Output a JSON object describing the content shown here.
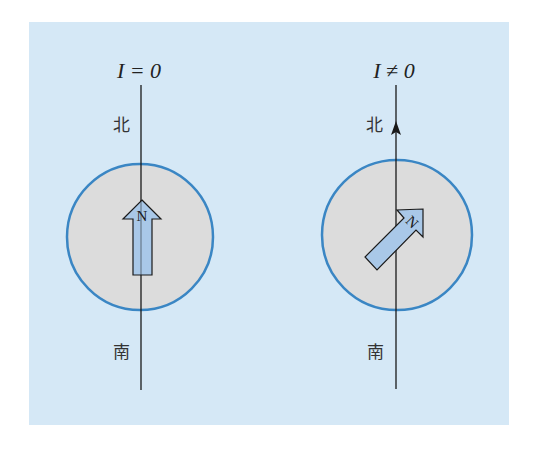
{
  "colors": {
    "panel_bg": "#d5e8f6",
    "circle_fill": "#dcdcdc",
    "circle_stroke": "#3a86c4",
    "needle_fill": "#a9c8e8",
    "line": "#1a1a1a"
  },
  "panels": [
    {
      "id": "no-current",
      "current_label": "I = 0",
      "north_label": "北",
      "south_label": "南",
      "needle_label": "N",
      "needle_angle_deg": 0,
      "wire_has_current_arrow": false
    },
    {
      "id": "with-current",
      "current_label": "I ≠ 0",
      "north_label": "北",
      "south_label": "南",
      "needle_label": "N",
      "needle_angle_deg": 45,
      "wire_has_current_arrow": true
    }
  ]
}
